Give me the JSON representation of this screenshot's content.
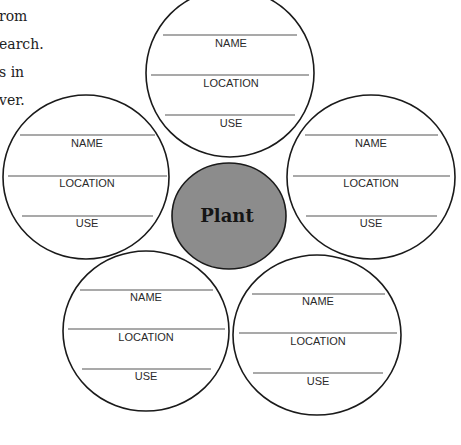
{
  "intro_text": [
    "rom",
    "earch.",
    "s in",
    "ver."
  ],
  "center": {
    "label": "Plant",
    "fill": "#8c8c8c"
  },
  "petals": [
    {
      "position": "top",
      "fields": [
        "NAME",
        "LOCATION",
        "USE"
      ]
    },
    {
      "position": "left",
      "fields": [
        "NAME",
        "LOCATION",
        "USE"
      ]
    },
    {
      "position": "right",
      "fields": [
        "NAME",
        "LOCATION",
        "USE"
      ]
    },
    {
      "position": "bottom-left",
      "fields": [
        "NAME",
        "LOCATION",
        "USE"
      ]
    },
    {
      "position": "bottom-right",
      "fields": [
        "NAME",
        "LOCATION",
        "USE"
      ]
    }
  ]
}
